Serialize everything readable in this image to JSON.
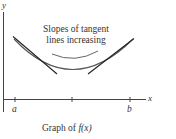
{
  "figure": {
    "annotation_line1": "Slopes of tangent",
    "annotation_line2": "lines increasing",
    "caption_prefix": "Graph of ",
    "caption_func": "f(x)",
    "axes": {
      "x_label": "x",
      "y_label": "y",
      "x_ticks": [
        "a",
        "b"
      ]
    },
    "colors": {
      "curve": "#555555",
      "tangent": "#222222",
      "axis": "#444444",
      "arrow": "#666666"
    }
  }
}
